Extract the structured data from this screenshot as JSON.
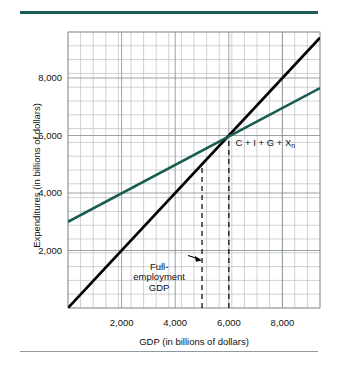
{
  "figure": {
    "background_color": "#ffffff",
    "rule_color": "#1a5c52",
    "rule_bottom_color": "#8f9aa0"
  },
  "chart_data": {
    "type": "line",
    "title": "",
    "xlabel": "GDP (in billions of dollars)",
    "ylabel": "Expenditures (in billions of dollars)",
    "xlim": [
      0,
      9400
    ],
    "ylim": [
      0,
      9600
    ],
    "xticks": [
      2000,
      4000,
      6000,
      8000
    ],
    "xtick_labels": [
      "2,000",
      "4,000",
      "6,000",
      "8,000"
    ],
    "yticks": [
      2000,
      4000,
      6000,
      8000
    ],
    "ytick_labels": [
      "2,000",
      "4,000",
      "6,000",
      "8,000"
    ],
    "grid": true,
    "grid_color": "#b9bec2",
    "grid_minor_step_x": 470,
    "grid_minor_step_y": 480,
    "legend": "none",
    "series": [
      {
        "name": "45-degree line",
        "label": "",
        "color": "#000000",
        "width": 2.6,
        "points": [
          [
            0,
            0
          ],
          [
            9400,
            9400
          ]
        ]
      },
      {
        "name": "C + I + G + Xn",
        "label": "C + I + G + X",
        "label_subscript": "n",
        "color": "#1a5c52",
        "width": 2.6,
        "points": [
          [
            0,
            3000
          ],
          [
            9400,
            7650
          ]
        ]
      }
    ],
    "reference_lines": [
      {
        "name": "full-employment-gdp",
        "orientation": "vertical",
        "x": 5000,
        "y_from": 0,
        "y_to": 5000,
        "style": "dashed",
        "color": "#000000"
      },
      {
        "name": "equilibrium-gdp",
        "orientation": "vertical",
        "x": 6000,
        "y_from": 0,
        "y_to": 6000,
        "style": "dashed",
        "color": "#000000"
      }
    ],
    "annotations": [
      {
        "name": "full-employment-gdp-annotation",
        "text": "Full-\nemployment\nGDP",
        "x": 3400,
        "y": 1400,
        "arrow_to_x": 5000,
        "arrow_to_y": 1650
      }
    ]
  }
}
